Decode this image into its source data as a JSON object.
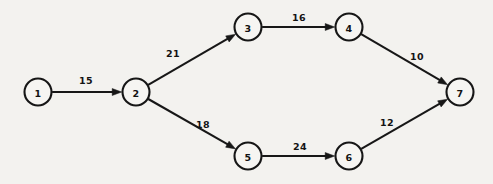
{
  "diagram": {
    "kind": "directed-weighted-network",
    "title": "",
    "canvas": {
      "width": 493,
      "height": 184
    },
    "colors": {
      "background": "#f3f2ef",
      "stroke": "#161616",
      "node_fill": "#f6f5f2",
      "text": "#131313"
    },
    "node_radius": 13.5,
    "nodes": [
      {
        "id": "1",
        "label": "1",
        "x": 38,
        "y": 92
      },
      {
        "id": "2",
        "label": "2",
        "x": 136,
        "y": 92
      },
      {
        "id": "3",
        "label": "3",
        "x": 248,
        "y": 27
      },
      {
        "id": "4",
        "label": "4",
        "x": 349,
        "y": 27
      },
      {
        "id": "5",
        "label": "5",
        "x": 248,
        "y": 156
      },
      {
        "id": "6",
        "label": "6",
        "x": 349,
        "y": 156
      },
      {
        "id": "7",
        "label": "7",
        "x": 460,
        "y": 92
      }
    ],
    "edges": [
      {
        "from": "1",
        "to": "2",
        "weight": "15",
        "label_x": 86,
        "label_y": 80
      },
      {
        "from": "2",
        "to": "3",
        "weight": "21",
        "label_x": 173,
        "label_y": 53
      },
      {
        "from": "2",
        "to": "5",
        "weight": "18",
        "label_x": 203,
        "label_y": 124
      },
      {
        "from": "3",
        "to": "4",
        "weight": "16",
        "label_x": 299,
        "label_y": 17
      },
      {
        "from": "4",
        "to": "7",
        "weight": "10",
        "label_x": 417,
        "label_y": 56
      },
      {
        "from": "5",
        "to": "6",
        "weight": "24",
        "label_x": 300,
        "label_y": 146
      },
      {
        "from": "6",
        "to": "7",
        "weight": "12",
        "label_x": 387,
        "label_y": 122
      }
    ]
  },
  "chart_data": {
    "type": "diagram",
    "subtype": "directed acyclic graph / activity network",
    "title": "",
    "xlabel": "",
    "ylabel": "",
    "nodes": [
      "1",
      "2",
      "3",
      "4",
      "5",
      "6",
      "7"
    ],
    "edges": [
      {
        "source": "1",
        "target": "2",
        "weight": 15
      },
      {
        "source": "2",
        "target": "3",
        "weight": 21
      },
      {
        "source": "2",
        "target": "5",
        "weight": 18
      },
      {
        "source": "3",
        "target": "4",
        "weight": 16
      },
      {
        "source": "4",
        "target": "7",
        "weight": 10
      },
      {
        "source": "5",
        "target": "6",
        "weight": 24
      },
      {
        "source": "6",
        "target": "7",
        "weight": 12
      }
    ],
    "paths": [
      {
        "nodes": [
          "1",
          "2",
          "3",
          "4",
          "7"
        ],
        "total": 62
      },
      {
        "nodes": [
          "1",
          "2",
          "5",
          "6",
          "7"
        ],
        "total": 69
      }
    ],
    "directed": true,
    "grid": false,
    "legend": "none"
  }
}
